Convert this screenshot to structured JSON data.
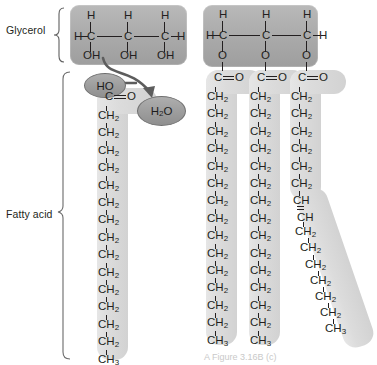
{
  "figure": {
    "caption": "A Figure 3.16B  (c)",
    "labels": {
      "glycerol": "Glycerol",
      "fatty_acid": "Fatty acid"
    },
    "colors": {
      "glycerol_box": "#a9a9a9",
      "chain_capsule": "#dcdcdc",
      "oval_fill": "#9b9b9b",
      "text": "#231f20",
      "arrow": "#5d5d5d"
    }
  },
  "glycerol_left": {
    "top_atoms": [
      "H",
      "H",
      "H"
    ],
    "backbone": [
      "C",
      "C",
      "C"
    ],
    "left_terminal": "H",
    "right_terminal": "H",
    "bottom_groups": [
      "OH",
      "OH",
      "OH"
    ]
  },
  "glycerol_right": {
    "top_atoms": [
      "H",
      "H",
      "H"
    ],
    "backbone": [
      "C",
      "C",
      "C"
    ],
    "left_terminal": "H",
    "right_terminal": "H",
    "bottom_groups": [
      "O",
      "O",
      "O"
    ]
  },
  "reaction": {
    "hydroxyl_label": "HO",
    "water_label": "H2O",
    "water_display": "H",
    "water_sub": "2",
    "water_tail": "O"
  },
  "free_fatty_acid": {
    "carbonyl": "C",
    "carbonyl_oxygen": "O",
    "chain": [
      "CH2",
      "CH2",
      "CH2",
      "CH2",
      "CH2",
      "CH2",
      "CH2",
      "CH2",
      "CH2",
      "CH2",
      "CH2",
      "CH2",
      "CH2",
      "CH2"
    ],
    "terminal": "CH3",
    "ch2_display": "CH",
    "ch2_sub": "2",
    "ch3_display": "CH",
    "ch3_sub": "3"
  },
  "ester_chains": [
    {
      "name": "saturated-chain-1",
      "carbonyl": "C",
      "carbonyl_oxygen": "O",
      "units": [
        "CH2",
        "CH2",
        "CH2",
        "CH2",
        "CH2",
        "CH2",
        "CH2",
        "CH2",
        "CH2",
        "CH2",
        "CH2",
        "CH2",
        "CH2",
        "CH2"
      ],
      "terminal": "CH3",
      "bent": false
    },
    {
      "name": "saturated-chain-2",
      "carbonyl": "C",
      "carbonyl_oxygen": "O",
      "units": [
        "CH2",
        "CH2",
        "CH2",
        "CH2",
        "CH2",
        "CH2",
        "CH2",
        "CH2",
        "CH2",
        "CH2",
        "CH2",
        "CH2",
        "CH2",
        "CH2"
      ],
      "terminal": "CH3",
      "bent": false
    },
    {
      "name": "unsaturated-chain-3",
      "carbonyl": "C",
      "carbonyl_oxygen": "O",
      "units_before_kink": [
        "CH2",
        "CH2",
        "CH2",
        "CH2",
        "CH2",
        "CH2"
      ],
      "double_bond": [
        "CH",
        "CH"
      ],
      "units_after_kink": [
        "CH2",
        "CH2",
        "CH2",
        "CH2",
        "CH2",
        "CH2"
      ],
      "terminal": "CH3",
      "bent": true
    }
  ]
}
